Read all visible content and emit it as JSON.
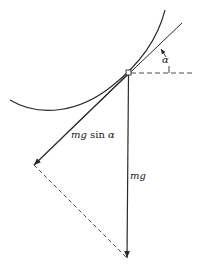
{
  "diagram": {
    "title": "",
    "labels": {
      "angle": "α",
      "component_force": "mg sin α",
      "component_mass": "mg",
      "component_sin": "sin",
      "component_alpha": "α",
      "weight": "mg"
    },
    "colors": {
      "stroke": "#2a2a2a",
      "dashed": "#3a3a3a",
      "background": "#ffffff"
    },
    "elements": [
      {
        "id": "curve",
        "type": "curve",
        "description": "concave-up track/path"
      },
      {
        "id": "tangent",
        "type": "line",
        "description": "tangent line at contact point"
      },
      {
        "id": "horizontal",
        "type": "dashed-line",
        "description": "horizontal reference"
      },
      {
        "id": "weight",
        "type": "arrow",
        "label": "mg",
        "direction": "down"
      },
      {
        "id": "tangential",
        "type": "arrow",
        "label": "mg sin α",
        "direction": "down-left along tangent"
      },
      {
        "id": "completion",
        "type": "dashed-line",
        "description": "parallelogram completion line"
      },
      {
        "id": "angle-arc",
        "type": "arrow",
        "label": "α"
      }
    ]
  }
}
